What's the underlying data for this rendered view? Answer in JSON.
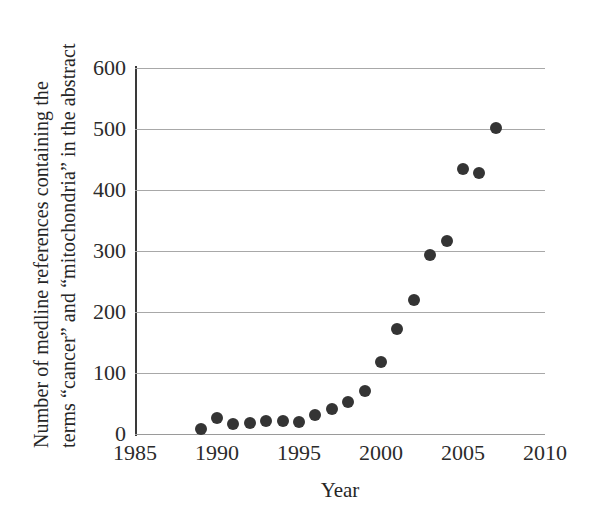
{
  "chart_data": {
    "type": "scatter",
    "title": "",
    "xlabel": "Year",
    "ylabel": "Number of medline references containing the terms “cancer” and “mitochondria” in the abstract",
    "ylabel_lines": [
      "Number of medline references containing the",
      "terms “cancer” and “mitochondria” in the abstract"
    ],
    "xlim": [
      1985,
      2010
    ],
    "ylim": [
      0,
      600
    ],
    "xticks": [
      "1985",
      "1990",
      "1995",
      "2000",
      "2005",
      "2010"
    ],
    "yticks": [
      "0",
      "100",
      "200",
      "300",
      "400",
      "500",
      "600"
    ],
    "xtick_values": [
      1985,
      1990,
      1995,
      2000,
      2005,
      2010
    ],
    "ytick_values": [
      0,
      100,
      200,
      300,
      400,
      500,
      600
    ],
    "grid": "horizontal",
    "legend": "none",
    "marker": "filled-circle",
    "marker_color": "#343434",
    "gridline_color": "#a8a8a8",
    "axis_color": "#3a3a3a",
    "x": [
      1989,
      1990,
      1991,
      1992,
      1993,
      1994,
      1995,
      1996,
      1997,
      1998,
      1999,
      2000,
      2001,
      2002,
      2003,
      2004,
      2005,
      2006,
      2007
    ],
    "values": [
      8,
      27,
      16,
      18,
      22,
      21,
      20,
      31,
      41,
      53,
      70,
      118,
      172,
      219,
      293,
      317,
      434,
      428,
      502
    ],
    "points": [
      {
        "year": 1989,
        "count": 8
      },
      {
        "year": 1990,
        "count": 27
      },
      {
        "year": 1991,
        "count": 16
      },
      {
        "year": 1992,
        "count": 18
      },
      {
        "year": 1993,
        "count": 22
      },
      {
        "year": 1994,
        "count": 21
      },
      {
        "year": 1995,
        "count": 20
      },
      {
        "year": 1996,
        "count": 31
      },
      {
        "year": 1997,
        "count": 41
      },
      {
        "year": 1998,
        "count": 53
      },
      {
        "year": 1999,
        "count": 70
      },
      {
        "year": 2000,
        "count": 118
      },
      {
        "year": 2001,
        "count": 172
      },
      {
        "year": 2002,
        "count": 219
      },
      {
        "year": 2003,
        "count": 293
      },
      {
        "year": 2004,
        "count": 317
      },
      {
        "year": 2005,
        "count": 434
      },
      {
        "year": 2006,
        "count": 428
      },
      {
        "year": 2007,
        "count": 502
      }
    ]
  }
}
